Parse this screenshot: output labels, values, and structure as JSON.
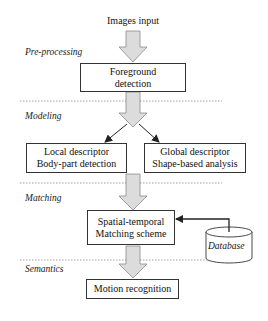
{
  "diagram": {
    "input_label": "Images input",
    "stages": [
      {
        "name": "Pre-processing"
      },
      {
        "name": "Modeling"
      },
      {
        "name": "Matching"
      },
      {
        "name": "Semantics"
      }
    ],
    "nodes": {
      "foreground": {
        "line1": "Foreground",
        "line2": "detection"
      },
      "local": {
        "line1": "Local descriptor",
        "line2": "Body-part detection"
      },
      "global": {
        "line1": "Global descriptor",
        "line2": "Shape-based analysis"
      },
      "matching": {
        "line1": "Spatial-temporal",
        "line2": "Matching scheme"
      },
      "motion": {
        "line1": "Motion recognition"
      },
      "database": {
        "label": "Database"
      }
    },
    "edges": [
      {
        "from": "Images input",
        "to": "foreground",
        "style": "block-arrow"
      },
      {
        "from": "foreground",
        "to": "local",
        "style": "block-arrow+line"
      },
      {
        "from": "foreground",
        "to": "global",
        "style": "block-arrow+line"
      },
      {
        "from": "modeling",
        "to": "matching",
        "style": "block-arrow"
      },
      {
        "from": "database",
        "to": "matching",
        "style": "line-arrow"
      },
      {
        "from": "matching",
        "to": "motion",
        "style": "block-arrow"
      }
    ],
    "colors": {
      "arrow_fill": "#dcdcdc",
      "arrow_stroke": "#8a8a8a",
      "box_border": "#333333",
      "dashed_line": "#888888"
    }
  }
}
